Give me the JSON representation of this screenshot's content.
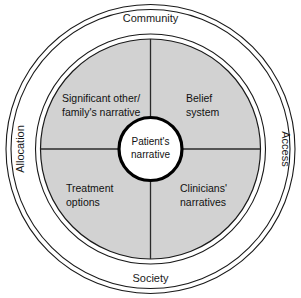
{
  "diagram": {
    "center": {
      "line1": "Patient's",
      "line2": "narrative"
    },
    "quadrants": [
      {
        "id": "top-left",
        "line1": "Significant other/",
        "line2": "family's narrative"
      },
      {
        "id": "top-right",
        "line1": "Belief",
        "line2": "system"
      },
      {
        "id": "bottom-left",
        "line1": "Treatment",
        "line2": "options"
      },
      {
        "id": "bottom-right",
        "line1": "Clinicians'",
        "line2": "narratives"
      }
    ],
    "ring_labels": [
      {
        "id": "top",
        "label": "Community"
      },
      {
        "id": "right",
        "label": "Access"
      },
      {
        "id": "bottom",
        "label": "Society"
      },
      {
        "id": "left",
        "label": "Allocation"
      }
    ],
    "colors": {
      "disc_fill": "#d2d2d2",
      "ring_fill": "#ffffff",
      "outline": "#1a1a1a",
      "center_fill": "#ffffff",
      "background": "#ffffff"
    }
  }
}
